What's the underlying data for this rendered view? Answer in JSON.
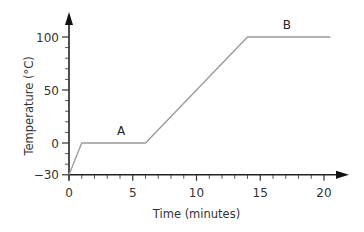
{
  "chart_data": {
    "type": "line",
    "title": "",
    "xlabel": "Time (minutes)",
    "ylabel": "Temperature (°C)",
    "xlim": [
      0,
      20
    ],
    "ylim": [
      -30,
      100
    ],
    "x_ticks": [
      0,
      5,
      10,
      15,
      20
    ],
    "y_ticks": [
      -30,
      0,
      50,
      100
    ],
    "x_tick_labels": [
      "0",
      "5",
      "10",
      "15",
      "20"
    ],
    "y_tick_labels": [
      "−30",
      "0",
      "50",
      "100"
    ],
    "x_minor_step": 1,
    "y_minor_step": 10,
    "grid": false,
    "series": [
      {
        "name": "Heating curve",
        "points": [
          {
            "x": 0,
            "y": -30
          },
          {
            "x": 1,
            "y": 0
          },
          {
            "x": 6,
            "y": 0
          },
          {
            "x": 14,
            "y": 100
          },
          {
            "x": 20.5,
            "y": 100
          }
        ]
      }
    ],
    "annotations": [
      {
        "label": "A",
        "x": 4,
        "y": 0
      },
      {
        "label": "B",
        "x": 17,
        "y": 100
      }
    ],
    "line_color": "#9a9a9a",
    "axis_color": "#222222"
  }
}
